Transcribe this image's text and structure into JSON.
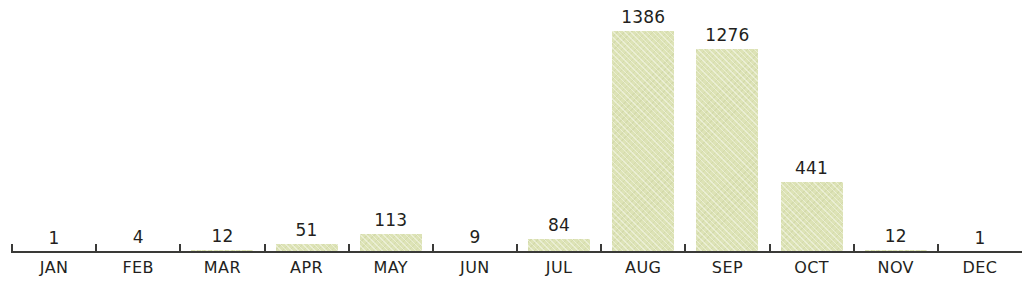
{
  "chart_data": {
    "type": "bar",
    "title": "",
    "subtitle": "",
    "xlabel": "",
    "ylabel": "",
    "categories": [
      "JAN",
      "FEB",
      "MAR",
      "APR",
      "MAY",
      "JUN",
      "JUL",
      "AUG",
      "SEP",
      "OCT",
      "NOV",
      "DEC"
    ],
    "values": [
      1,
      4,
      12,
      51,
      113,
      9,
      84,
      1386,
      1276,
      441,
      12,
      1
    ],
    "value_labels": [
      "1",
      "4",
      "12",
      "51",
      "113",
      "9",
      "84",
      "1386",
      "1276",
      "441",
      "12",
      "1"
    ],
    "ylim": [
      0,
      1386
    ],
    "grid": false,
    "legend": null,
    "annotations": [],
    "axis": {
      "x_axis_visible": true,
      "y_axis_visible": false,
      "tick_marks": 12,
      "tick_labels_position": "below-axis"
    },
    "series": [
      {
        "name": "",
        "values": [
          1,
          4,
          12,
          51,
          113,
          9,
          84,
          1386,
          1276,
          441,
          12,
          1
        ]
      }
    ]
  },
  "style": {
    "background_color": "#ffffff",
    "bar_fill_color": "#dde3b6",
    "axis_color": "#3a3a38",
    "text_color": "#231f20"
  }
}
